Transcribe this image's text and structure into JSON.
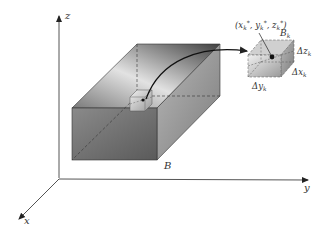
{
  "figure": {
    "axes": {
      "x_label": "x",
      "y_label": "y",
      "z_label": "z"
    },
    "region_label": "B",
    "subbox": {
      "label": "B",
      "label_subscript": "k",
      "point_label": "(xₖ*, yₖ*, zₖ*)",
      "point_x": "x",
      "point_y": "y",
      "point_z": "z",
      "subscript": "k",
      "star": "*",
      "dx_label": "Δx",
      "dy_label": "Δy",
      "dz_label": "Δz"
    },
    "colors": {
      "axis": "#555555",
      "box_front": "#6e6e6e",
      "box_top_light": "#d8d8d8",
      "box_top_dark": "#4a4a4a",
      "box_right": "#9a9a9a",
      "dashed": "#444444",
      "arrow": "#111111"
    }
  }
}
